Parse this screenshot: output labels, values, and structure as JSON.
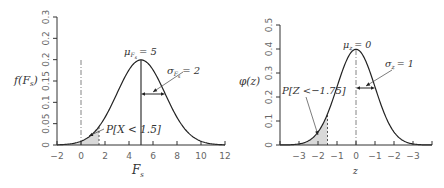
{
  "chart_data": [
    {
      "type": "line",
      "title": "",
      "xlabel": "F_s",
      "ylabel": "f(F_s)",
      "xlim": [
        -2,
        12
      ],
      "ylim": [
        0,
        0.3
      ],
      "x_ticks": [
        -2,
        0,
        2,
        4,
        6,
        8,
        10,
        12
      ],
      "x_tick_labels": [
        "−2",
        "0",
        "2",
        "4",
        "6",
        "8",
        "10",
        "12"
      ],
      "y_ticks": [
        0,
        0.05,
        0.1,
        0.15,
        0.2,
        0.25,
        0.3
      ],
      "y_tick_labels": [
        "0",
        "0.05",
        "0.1",
        "0.15",
        "0.2",
        "0.2",
        "0.3"
      ],
      "grid": false,
      "series": [
        {
          "name": "normal pdf",
          "distribution": "normal",
          "mean": 5,
          "sd": 2
        }
      ],
      "shaded_region": {
        "from": -2,
        "to": 1.5,
        "label": "P[X < 1.5]"
      },
      "reference_line_x": 0,
      "annotations": {
        "mean": {
          "symbol": "μ",
          "subscript": "F_s",
          "value": "5",
          "text": "μ_Fs = 5"
        },
        "sd": {
          "symbol": "σ",
          "subscript": "F_s",
          "value": "2",
          "text": "σ_Fs = 2"
        },
        "prob": "P[X < 1.5]"
      }
    },
    {
      "type": "line",
      "title": "",
      "xlabel": "z",
      "ylabel": "φ(z)",
      "xlim": [
        -4,
        4
      ],
      "ylim": [
        0,
        0.5
      ],
      "x_ticks": [
        -4,
        -3,
        -2,
        -1,
        0,
        1,
        2,
        3,
        4
      ],
      "x_tick_labels": [
        "",
        "−3",
        "−2",
        "−1",
        "0",
        "−1",
        "−2",
        "−3",
        ""
      ],
      "y_ticks": [
        0,
        0.1,
        0.2,
        0.3,
        0.4,
        0.5
      ],
      "y_tick_labels": [
        "0",
        "0.1",
        "0.2",
        "0.3",
        "0.4",
        "0.5"
      ],
      "grid": false,
      "series": [
        {
          "name": "standard normal pdf",
          "distribution": "normal",
          "mean": 0,
          "sd": 1
        }
      ],
      "shaded_region": {
        "from": -4,
        "to": -1.5,
        "label": "P[Z < −1.75]"
      },
      "reference_line_x": 0,
      "annotations": {
        "mean": {
          "symbol": "μ",
          "subscript": "z",
          "value": "0",
          "text": "μ_z = 0"
        },
        "sd": {
          "symbol": "σ",
          "subscript": "z",
          "value": "1",
          "text": "σ_z = 1"
        },
        "prob": "P[Z <−1.75]"
      }
    }
  ],
  "labels": {
    "left": {
      "ylabel_f": "f",
      "ylabel_arg": "F",
      "ylabel_sub": "s",
      "xlabel_main": "F",
      "xlabel_sub": "s",
      "mu_sym": "μ",
      "mu_sub": "F",
      "mu_subsub": "s",
      "mu_val": "= 5",
      "sigma_sym": "σ",
      "sigma_sub": "F",
      "sigma_subsub": "s",
      "sigma_val": "= 2",
      "prob_P": "P",
      "prob_body": "[X < 1.5]"
    },
    "right": {
      "ylabel_phi": "φ",
      "ylabel_arg": "(z)",
      "xlabel": "z",
      "mu_sym": "μ",
      "mu_sub": "z",
      "mu_val": "= 0",
      "sigma_sym": "σ",
      "sigma_sub": "z",
      "sigma_val": "= 1",
      "prob_P": "P",
      "prob_body": "[Z <−1.75]"
    }
  }
}
